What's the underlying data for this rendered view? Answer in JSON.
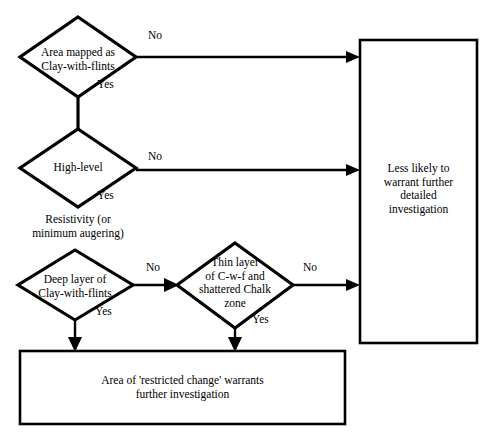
{
  "diagram": {
    "type": "flowchart",
    "colors": {
      "stroke": "#000000",
      "fill": "#ffffff",
      "text": "#000000",
      "background": "#ffffff"
    },
    "nodes": [
      {
        "id": "d1",
        "shape": "diamond",
        "line1": "Area mapped as",
        "line2": "Clay-with-flints"
      },
      {
        "id": "d2",
        "shape": "diamond",
        "line1": "High-level",
        "line2": ""
      },
      {
        "id": "d3",
        "shape": "diamond",
        "line1": "Deep layer of",
        "line2": "Clay-with-flints"
      },
      {
        "id": "d4",
        "shape": "diamond",
        "line1": "Thin layer",
        "line2": "of C-w-f and",
        "line3": "shattered Chalk",
        "line4": "zone"
      },
      {
        "id": "box_right",
        "shape": "rectangle",
        "line1": "Less likely to",
        "line2": "warrant further",
        "line3": "detailed",
        "line4": "investigation"
      },
      {
        "id": "box_bottom",
        "shape": "rectangle",
        "line1": "Area of 'restricted change' warrants",
        "line2": "further investigation"
      }
    ],
    "free_text": {
      "resistivity_line1": "Resistivity (or",
      "resistivity_line2": "minimum augering)"
    },
    "edge_labels": {
      "no_1": "No",
      "yes_1": "Yes",
      "no_2": "No",
      "yes_2": "Yes",
      "no_3": "No",
      "yes_3": "Yes",
      "no_4": "No",
      "yes_4": "Yes"
    }
  }
}
